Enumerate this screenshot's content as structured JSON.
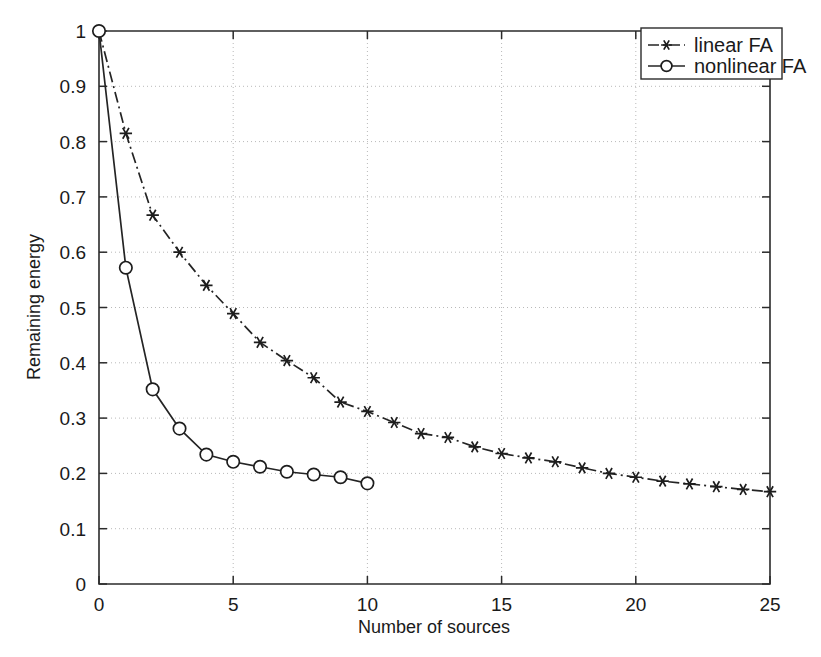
{
  "chart_data": {
    "type": "line",
    "title": "",
    "xlabel": "Number of sources",
    "ylabel": "Remaining energy",
    "xlim": [
      0,
      25
    ],
    "ylim": [
      0,
      1
    ],
    "grid": true,
    "legend_position": "top-right",
    "xticks": [
      "0",
      "5",
      "10",
      "15",
      "20",
      "25"
    ],
    "xtick_values": [
      0,
      5,
      10,
      15,
      20,
      25
    ],
    "yticks": [
      "0",
      "0.1",
      "0.2",
      "0.3",
      "0.4",
      "0.5",
      "0.6",
      "0.7",
      "0.8",
      "0.9",
      "1"
    ],
    "ytick_values": [
      0,
      0.1,
      0.2,
      0.3,
      0.4,
      0.5,
      0.6,
      0.7,
      0.8,
      0.9,
      1
    ],
    "series": [
      {
        "name": "linear FA",
        "marker": "star",
        "linestyle": "dash-dot",
        "color": "#242424",
        "x": [
          0,
          1,
          2,
          3,
          4,
          5,
          6,
          7,
          8,
          9,
          10,
          11,
          12,
          13,
          14,
          15,
          16,
          17,
          18,
          19,
          20,
          21,
          22,
          23,
          24,
          25
        ],
        "values": [
          1.0,
          0.815,
          0.667,
          0.6,
          0.54,
          0.489,
          0.437,
          0.404,
          0.373,
          0.329,
          0.312,
          0.292,
          0.272,
          0.265,
          0.248,
          0.236,
          0.228,
          0.221,
          0.21,
          0.2,
          0.193,
          0.186,
          0.181,
          0.176,
          0.171,
          0.167
        ]
      },
      {
        "name": "nonlinear FA",
        "marker": "circle",
        "linestyle": "solid",
        "color": "#242424",
        "x": [
          0,
          1,
          2,
          3,
          4,
          5,
          6,
          7,
          8,
          9,
          10
        ],
        "values": [
          1.0,
          0.572,
          0.352,
          0.281,
          0.234,
          0.221,
          0.212,
          0.203,
          0.198,
          0.193,
          0.182
        ]
      }
    ]
  },
  "legend": {
    "entries": [
      {
        "label": "linear FA"
      },
      {
        "label": "nonlinear FA"
      }
    ]
  }
}
